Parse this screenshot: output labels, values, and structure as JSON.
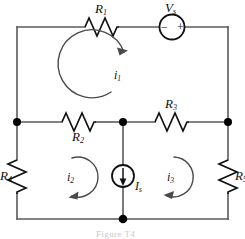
{
  "figure": {
    "caption": "Figure T4"
  },
  "colors": {
    "wire": "#5a5a5a",
    "component": "#111111",
    "node": "#000000",
    "caption": "#c9c9c9",
    "background": "#ffffff"
  },
  "components": {
    "r1": {
      "label": "R",
      "sub": "1",
      "name": "resistor-r1",
      "orientation": "horizontal",
      "position": "top-left-branch"
    },
    "r2": {
      "label": "R",
      "sub": "2",
      "name": "resistor-r2",
      "orientation": "horizontal",
      "position": "middle-left-branch"
    },
    "r3": {
      "label": "R",
      "sub": "3",
      "name": "resistor-r3",
      "orientation": "horizontal",
      "position": "middle-right-branch"
    },
    "r4": {
      "label": "R",
      "sub": "4",
      "name": "resistor-r4",
      "orientation": "vertical",
      "position": "left-branch"
    },
    "r5": {
      "label": "R",
      "sub": "5",
      "name": "resistor-r5",
      "orientation": "vertical",
      "position": "right-branch"
    },
    "vs": {
      "label": "V",
      "sub": "s",
      "name": "voltage-source",
      "minus": "−",
      "plus": "+",
      "position": "top-right-branch"
    },
    "is": {
      "label": "I",
      "sub": "s",
      "name": "current-source",
      "arrow_direction": "down",
      "position": "center-branch"
    }
  },
  "mesh_currents": [
    {
      "label": "i",
      "sub": "1",
      "name": "mesh-current-i1",
      "direction": "clockwise",
      "mesh": "top"
    },
    {
      "label": "i",
      "sub": "2",
      "name": "mesh-current-i2",
      "direction": "clockwise",
      "mesh": "bottom-left"
    },
    {
      "label": "i",
      "sub": "3",
      "name": "mesh-current-i3",
      "direction": "clockwise",
      "mesh": "bottom-right"
    }
  ],
  "nodes": [
    {
      "name": "node-middle-left"
    },
    {
      "name": "node-middle-center"
    },
    {
      "name": "node-middle-right"
    },
    {
      "name": "node-bottom-center"
    }
  ]
}
